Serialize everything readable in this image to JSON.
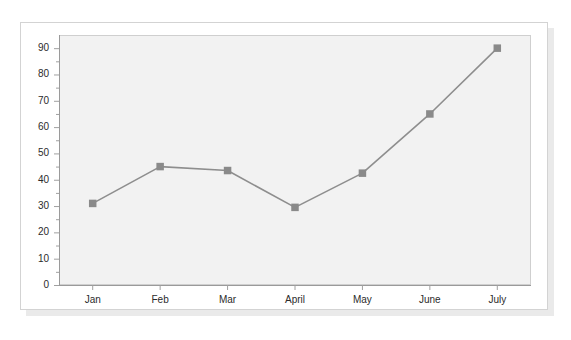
{
  "chart_data": {
    "type": "line",
    "title": "",
    "subtitle": "",
    "xlabel": "",
    "ylabel": "",
    "categories": [
      "Jan",
      "Feb",
      "Mar",
      "April",
      "May",
      "June",
      "July"
    ],
    "values": [
      31,
      45,
      43.5,
      29.5,
      42.5,
      65,
      90
    ],
    "series": [
      {
        "name": "",
        "values": [
          31,
          45,
          43.5,
          29.5,
          42.5,
          65,
          90
        ]
      }
    ],
    "ylim": [
      0,
      95
    ],
    "y_major_ticks": [
      0,
      10,
      20,
      30,
      40,
      50,
      60,
      70,
      80,
      90
    ],
    "y_minor_ticks": [
      5,
      15,
      25,
      35,
      45,
      55,
      65,
      75,
      85
    ],
    "y_tick_labels": [
      "0",
      "10",
      "20",
      "30",
      "40",
      "50",
      "60",
      "70",
      "80",
      "90"
    ],
    "grid": false,
    "legend": "none",
    "marker": "square",
    "line_color": "#8e8e8e",
    "marker_color": "#8a8a8a",
    "plot_background": "#f2f2f2",
    "axis_color": "#a0a0a0",
    "text_color": "#2b2b2b"
  },
  "card": {
    "background": "#ffffff",
    "border_color": "#d3d3d3",
    "shadow_color": "#d8d8d8"
  }
}
